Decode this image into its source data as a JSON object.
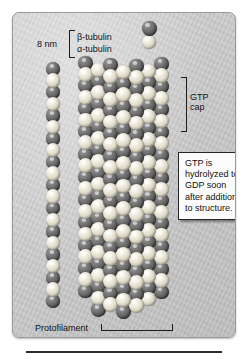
{
  "figure": {
    "panel_color": "#cdcdcd",
    "border_color": "#9a9a9a"
  },
  "legend": {
    "scale_label": "8 nm",
    "bracket_icon": "left-square-bracket",
    "subunits": [
      {
        "label": "β-tubulin",
        "color": "#5f5f5f",
        "role": "beta"
      },
      {
        "label": "α-tubulin",
        "color": "#ddd8c6",
        "role": "alpha"
      }
    ]
  },
  "annotations": {
    "gtp_cap_line1": "GTP",
    "gtp_cap_line2": "cap",
    "gtp_cap_bracket_icon": "right-square-bracket",
    "protofilament_label": "Protofilament",
    "diameter_label": "24 nm",
    "diameter_bracket_icon": "dimension-bracket"
  },
  "callout": {
    "text": "GTP is hydrolyzed to GDP soon after addition to structure.",
    "background": "#fbfbfb",
    "border_color": "#262626"
  },
  "structures": {
    "dimer": {
      "name": "tubulin-heterodimer",
      "spheres": 2
    },
    "protofilament": {
      "name": "single-protofilament",
      "spheres": 22
    },
    "microtubule": {
      "name": "microtubule-cylinder",
      "columns": 7,
      "rows": 17
    }
  }
}
